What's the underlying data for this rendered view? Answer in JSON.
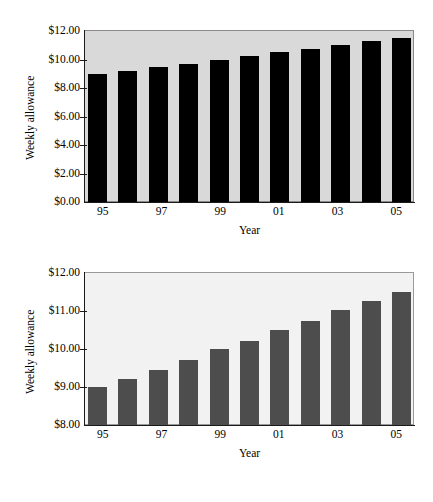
{
  "chart_data": [
    {
      "id": "top",
      "type": "bar",
      "title": "",
      "xlabel": "Year",
      "ylabel": "Weekly allowance",
      "categories": [
        "95",
        "96",
        "97",
        "98",
        "99",
        "00",
        "01",
        "02",
        "03",
        "04",
        "05"
      ],
      "tick_categories": [
        "95",
        "97",
        "99",
        "01",
        "03",
        "05"
      ],
      "values": [
        9.0,
        9.22,
        9.45,
        9.72,
        10.0,
        10.22,
        10.5,
        10.75,
        11.02,
        11.27,
        11.5
      ],
      "ylim": [
        0.0,
        12.0
      ],
      "yticks": [
        0.0,
        2.0,
        4.0,
        6.0,
        8.0,
        10.0,
        12.0
      ],
      "ytick_labels": [
        "$0.00",
        "$2.00",
        "$4.00",
        "$6.00",
        "$8.00",
        "$10.00",
        "$12.00"
      ],
      "grid": false,
      "legend": "none",
      "bar_color": "#000000",
      "plot_background": "#d9d9d9"
    },
    {
      "id": "bottom",
      "type": "bar",
      "title": "",
      "xlabel": "Year",
      "ylabel": "Weekly allowance",
      "categories": [
        "95",
        "96",
        "97",
        "98",
        "99",
        "00",
        "01",
        "02",
        "03",
        "04",
        "05"
      ],
      "tick_categories": [
        "95",
        "97",
        "99",
        "01",
        "03",
        "05"
      ],
      "values": [
        9.0,
        9.22,
        9.45,
        9.72,
        10.0,
        10.22,
        10.5,
        10.75,
        11.02,
        11.27,
        11.5
      ],
      "ylim": [
        8.0,
        12.0
      ],
      "yticks": [
        8.0,
        9.0,
        10.0,
        11.0,
        12.0
      ],
      "ytick_labels": [
        "$8.00",
        "$9.00",
        "$10.00",
        "$11.00",
        "$12.00"
      ],
      "grid": false,
      "legend": "none",
      "bar_color": "#4d4d4d",
      "plot_background": "#f2f2f2"
    }
  ]
}
